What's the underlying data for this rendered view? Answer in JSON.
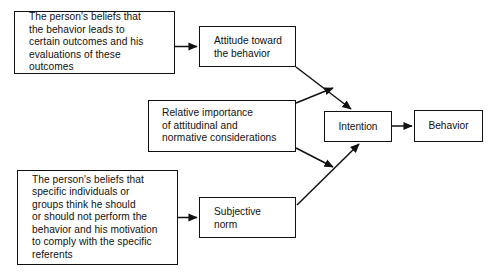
{
  "diagram": {
    "background_color": "#ffffff",
    "line_color": "#111111",
    "text_color": "#111111",
    "nodes": {
      "behavioral_beliefs": {
        "label": "The person's beliefs that\nthe behavior leads to\ncertain outcomes and his\nevaluations of these\noutcomes"
      },
      "attitude": {
        "label": "Attitude toward\nthe behavior"
      },
      "relative_importance": {
        "label": "Relative importance\nof attitudinal and\nnormative considerations"
      },
      "normative_beliefs": {
        "label": "The person's beliefs that\nspecific individuals or\ngroups think he should\nor should not perform the\nbehavior and his motivation\nto comply with the specific\nreferents"
      },
      "subjective_norm": {
        "label": "Subjective\nnorm"
      },
      "intention": {
        "label": "Intention"
      },
      "behavior": {
        "label": "Behavior"
      }
    },
    "edges": [
      {
        "id": "beliefs-to-attitude",
        "from": "behavioral_beliefs",
        "to": "attitude",
        "style": "solid-arrow"
      },
      {
        "id": "attitude-to-intention",
        "from": "attitude",
        "to": "intention",
        "style": "solid-arrow"
      },
      {
        "id": "importance-to-intention-upper",
        "from": "relative_importance",
        "to": "intention",
        "style": "solid-arrow"
      },
      {
        "id": "importance-to-intention-lower",
        "from": "relative_importance",
        "to": "intention",
        "style": "solid-arrow"
      },
      {
        "id": "normbeliefs-to-subjectivenorm",
        "from": "normative_beliefs",
        "to": "subjective_norm",
        "style": "solid-arrow"
      },
      {
        "id": "subjectivenorm-to-intention",
        "from": "subjective_norm",
        "to": "intention",
        "style": "solid-arrow"
      },
      {
        "id": "intention-to-behavior",
        "from": "intention",
        "to": "behavior",
        "style": "solid-arrow"
      }
    ]
  }
}
